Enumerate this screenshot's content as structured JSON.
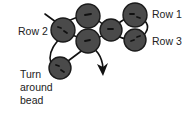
{
  "diagram": {
    "labels": {
      "row1": "Row 1",
      "row2": "Row 2",
      "row3": "Row 3",
      "turn_line1": "Turn",
      "turn_line2": "around",
      "turn_line3": "bead"
    },
    "beads": [
      {
        "id": "row2-left",
        "row": "Row 2"
      },
      {
        "id": "row1-top-middle",
        "row": "Row 1"
      },
      {
        "id": "row3-lower-middle",
        "row": "Row 3"
      },
      {
        "id": "row2-middle-right",
        "row": "Row 2"
      },
      {
        "id": "row1-top-right",
        "row": "Row 1"
      },
      {
        "id": "row3-lower-right",
        "row": "Row 3"
      },
      {
        "id": "turn-around",
        "row": "Turn around bead"
      }
    ],
    "colors": {
      "bead_fill": "#4a4a4a",
      "thread": "#111111",
      "text": "#222222",
      "background": "#ffffff"
    }
  }
}
